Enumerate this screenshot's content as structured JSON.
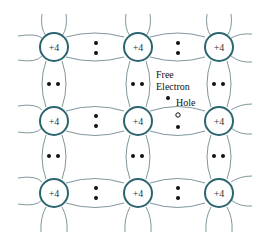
{
  "diagram": {
    "atom_label": "+4",
    "atoms": [
      {
        "row": 0,
        "col": 0,
        "label": "+4"
      },
      {
        "row": 0,
        "col": 1,
        "label": "+4"
      },
      {
        "row": 0,
        "col": 2,
        "label": "+4"
      },
      {
        "row": 1,
        "col": 0,
        "label": "+4"
      },
      {
        "row": 1,
        "col": 1,
        "label": "+4"
      },
      {
        "row": 1,
        "col": 2,
        "label": "+4"
      },
      {
        "row": 2,
        "col": 0,
        "label": "+4"
      },
      {
        "row": 2,
        "col": 1,
        "label": "+4"
      },
      {
        "row": 2,
        "col": 2,
        "label": "+4"
      }
    ],
    "annotations": {
      "free_electron_line1": "Free",
      "free_electron_line2": "Electron",
      "hole": "Hole"
    },
    "colors": {
      "atom_stroke": "#2c6470",
      "bond_line": "#6f8a8f",
      "electron": "#111111"
    }
  }
}
